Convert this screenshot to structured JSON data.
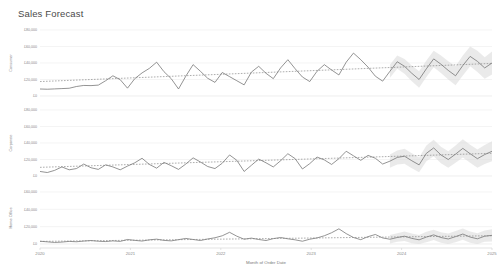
{
  "header": {
    "title": "Sales Forecast"
  },
  "axis": {
    "x_title": "Month of Order Date",
    "x_ticks": [
      "2020",
      "2021",
      "2022",
      "2023",
      "2024",
      "2025"
    ]
  },
  "colors": {
    "line": "#707070",
    "trend": "#808080",
    "band": "#d9d9d9",
    "grid": "#ededed",
    "text": "#888888",
    "title": "#4a4a4a"
  },
  "chart_data": {
    "type": "line",
    "title": "Sales Forecast",
    "xlabel": "Month of Order Date",
    "grid": true,
    "legend": "none",
    "x_ticks": [
      "2020",
      "2021",
      "2022",
      "2023",
      "2024",
      "2025"
    ],
    "x_range": [
      "2020-01",
      "2025-03"
    ],
    "forecast_start": "2024-01",
    "panels": [
      {
        "name": "Consumer",
        "ylabel": "Consumer",
        "ylim": [
          0,
          80000
        ],
        "y_ticks": [
          0,
          20000,
          40000,
          60000,
          80000
        ],
        "y_tick_labels": [
          "£0",
          "£20,000",
          "£40,000",
          "£60,000",
          "£80,000"
        ],
        "series": [
          {
            "name": "Actual",
            "kind": "line",
            "values": [
              8500,
              8200,
              8600,
              9000,
              9400,
              11500,
              12800,
              12600,
              13200,
              18500,
              24500,
              19800,
              9500,
              21000,
              28000,
              33500,
              41000,
              29500,
              21000,
              8500,
              24000,
              38000,
              30000,
              21500,
              16500,
              28500,
              23500,
              18500,
              13500,
              29000,
              36000,
              27500,
              21000,
              34000,
              44000,
              33000,
              23000,
              17500,
              30000,
              38000,
              31500,
              25500,
              41000,
              52000,
              44000,
              35000,
              24000,
              18000,
              30000,
              41500,
              36000,
              27500,
              20000,
              33000,
              45000,
              38500,
              31000,
              24500,
              37000,
              48000,
              42000,
              34000,
              40000
            ]
          },
          {
            "name": "Forecast",
            "kind": "line",
            "start_index": 48,
            "values": [
              30000,
              41500,
              36000,
              27500,
              20000,
              33000,
              45000,
              38500,
              31000,
              24500,
              37000,
              48000,
              42000,
              34000,
              40000
            ]
          },
          {
            "name": "Trend",
            "kind": "dashed-trend",
            "start_value": 17500,
            "end_value": 39500
          }
        ],
        "confidence_band": {
          "start_index": 48,
          "upper": [
            38000,
            49000,
            45000,
            37000,
            30000,
            43000,
            55000,
            49000,
            42000,
            36000,
            49000,
            60000,
            55000,
            47000,
            54000
          ],
          "lower": [
            22000,
            33000,
            27000,
            18000,
            10000,
            23000,
            35000,
            28000,
            20000,
            13000,
            25000,
            36000,
            29000,
            21000,
            26000
          ]
        }
      },
      {
        "name": "Corporate",
        "ylabel": "Corporate",
        "ylim": [
          0,
          80000
        ],
        "y_ticks": [
          0,
          20000,
          40000,
          60000,
          80000
        ],
        "y_tick_labels": [
          "£0",
          "£20,000",
          "£40,000",
          "£60,000",
          "£80,000"
        ],
        "series": [
          {
            "name": "Actual",
            "kind": "line",
            "values": [
              5500,
              4200,
              6800,
              11000,
              7500,
              9000,
              14500,
              10000,
              8000,
              13500,
              11000,
              7500,
              12000,
              16000,
              21500,
              14000,
              9500,
              16500,
              12500,
              8000,
              14500,
              22000,
              17000,
              11500,
              9000,
              15500,
              25500,
              19000,
              5500,
              13000,
              20500,
              16000,
              11000,
              18500,
              27000,
              21000,
              8500,
              15000,
              23000,
              19500,
              14000,
              21000,
              30000,
              24500,
              19000,
              25000,
              21500,
              14500,
              18000,
              22500,
              24000,
              18500,
              13500,
              27500,
              34000,
              25500,
              20000,
              26500,
              33500,
              27000,
              21000,
              26000,
              30000
            ]
          },
          {
            "name": "Forecast",
            "kind": "line",
            "start_index": 48,
            "values": [
              18000,
              22500,
              24000,
              18500,
              13500,
              27500,
              34000,
              25500,
              20000,
              26500,
              33500,
              27000,
              21000,
              26000,
              30000
            ]
          },
          {
            "name": "Trend",
            "kind": "dashed-trend",
            "start_value": 10500,
            "end_value": 27500
          }
        ],
        "confidence_band": {
          "start_index": 48,
          "upper": [
            26000,
            31000,
            33000,
            27500,
            22500,
            37000,
            44000,
            35500,
            30000,
            37000,
            44500,
            38000,
            32000,
            37500,
            42000
          ],
          "lower": [
            10000,
            14000,
            15000,
            9500,
            4500,
            18000,
            24000,
            15500,
            10000,
            16000,
            22500,
            16000,
            10000,
            14500,
            18000
          ]
        }
      },
      {
        "name": "Home Office",
        "ylabel": "Home Office",
        "ylim": [
          0,
          60000
        ],
        "y_ticks": [
          0,
          20000,
          40000,
          60000
        ],
        "y_tick_labels": [
          "£0",
          "£20,000",
          "£40,000",
          "£60,000"
        ],
        "series": [
          {
            "name": "Actual",
            "kind": "line",
            "values": [
              3200,
              2500,
              1800,
              2200,
              3000,
              2600,
              3400,
              4000,
              3200,
              2800,
              3600,
              3000,
              5200,
              4200,
              3400,
              4800,
              5600,
              4200,
              3600,
              5000,
              6400,
              5200,
              4000,
              5800,
              7200,
              9500,
              13500,
              9000,
              5500,
              6800,
              5200,
              4000,
              6200,
              7500,
              6000,
              4800,
              3200,
              5500,
              7000,
              9500,
              13000,
              17500,
              12000,
              7500,
              5000,
              8500,
              11000,
              7000,
              5500,
              7500,
              9000,
              6500,
              4800,
              8000,
              10500,
              7500,
              5800,
              8500,
              11500,
              8000,
              6000,
              9000,
              10000
            ]
          },
          {
            "name": "Forecast",
            "kind": "line",
            "start_index": 48,
            "values": [
              5500,
              7500,
              9000,
              6500,
              4800,
              8000,
              10500,
              7500,
              5800,
              8500,
              11500,
              8000,
              6000,
              9000,
              10000
            ]
          },
          {
            "name": "Trend",
            "kind": "dashed-trend",
            "start_value": 3000,
            "end_value": 9500
          }
        ],
        "confidence_band": {
          "start_index": 48,
          "upper": [
            10500,
            12500,
            14500,
            12000,
            10500,
            14000,
            16500,
            13500,
            12000,
            15000,
            18000,
            14500,
            12500,
            15500,
            17000
          ],
          "lower": [
            500,
            2500,
            3500,
            1000,
            -900,
            2000,
            4500,
            1500,
            -400,
            2000,
            5000,
            1500,
            -500,
            2500,
            3000
          ]
        }
      }
    ]
  }
}
